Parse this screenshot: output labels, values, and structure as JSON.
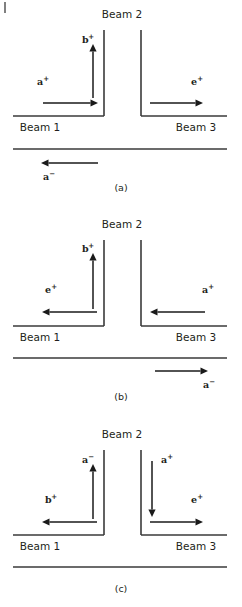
{
  "figure": {
    "width": 242,
    "height": 607,
    "background_color": "#ffffff",
    "line_color": "#3a3a3a",
    "arrow_color": "#1a1a1a",
    "text_color": "#231f20",
    "corner_tick_present": true
  },
  "common_labels": {
    "beam1": "Beam 1",
    "beam2": "Beam 2",
    "beam3": "Beam 3"
  },
  "panels": [
    {
      "id": "panel-a",
      "caption": "(a)",
      "caption_x": 121,
      "caption_y": 191,
      "beam2_label": {
        "text": "Beam 2",
        "x": 122,
        "y": 18
      },
      "beam1_label": {
        "text": "Beam 1",
        "x": 40,
        "y": 131
      },
      "beam3_label": {
        "text": "Beam 3",
        "x": 196,
        "y": 131
      },
      "walls": {
        "left_vertical": {
          "x": 104,
          "y1": 30,
          "y2": 116
        },
        "right_vertical": {
          "x": 141,
          "y1": 30,
          "y2": 116
        },
        "upper_horizontal_left": {
          "x1": 13,
          "x2": 104,
          "y": 116
        },
        "upper_horizontal_right": {
          "x1": 141,
          "x2": 227,
          "y": 116
        },
        "lower_horizontal": {
          "x1": 13,
          "x2": 227,
          "y": 149
        }
      },
      "arrows": [
        {
          "name": "a-plus-input",
          "label": "a",
          "superscript": "+",
          "label_x": 37,
          "label_y": 85,
          "direction": "right",
          "x1": 43,
          "y1": 103,
          "x2": 98,
          "y2": 103
        },
        {
          "name": "b-plus-up",
          "label": "b",
          "superscript": "+",
          "label_x": 82,
          "label_y": 43,
          "direction": "up",
          "x1": 93,
          "y1": 98,
          "x2": 93,
          "y2": 44
        },
        {
          "name": "e-plus-output",
          "label": "e",
          "superscript": "+",
          "label_x": 191,
          "label_y": 85,
          "direction": "right",
          "x1": 150,
          "y1": 103,
          "x2": 203,
          "y2": 103
        },
        {
          "name": "a-minus-return",
          "label": "a",
          "superscript": "−",
          "label_x": 43,
          "label_y": 180,
          "direction": "left",
          "x1": 98,
          "y1": 163,
          "x2": 41,
          "y2": 163
        }
      ]
    },
    {
      "id": "panel-b",
      "caption": "(b)",
      "caption_x": 121,
      "caption_y": 400,
      "beam2_label": {
        "text": "Beam 2",
        "x": 122,
        "y": 228
      },
      "beam1_label": {
        "text": "Beam 1",
        "x": 40,
        "y": 341
      },
      "beam3_label": {
        "text": "Beam 3",
        "x": 196,
        "y": 341
      },
      "walls": {
        "left_vertical": {
          "x": 104,
          "y1": 240,
          "y2": 326
        },
        "right_vertical": {
          "x": 141,
          "y1": 240,
          "y2": 326
        },
        "upper_horizontal_left": {
          "x1": 13,
          "x2": 104,
          "y": 326
        },
        "upper_horizontal_right": {
          "x1": 141,
          "x2": 227,
          "y": 326
        },
        "lower_horizontal": {
          "x1": 13,
          "x2": 227,
          "y": 358
        }
      },
      "arrows": [
        {
          "name": "b-plus-up",
          "label": "b",
          "superscript": "+",
          "label_x": 82,
          "label_y": 252,
          "direction": "up",
          "x1": 93,
          "y1": 309,
          "x2": 93,
          "y2": 253
        },
        {
          "name": "e-plus-output-left",
          "label": "e",
          "superscript": "+",
          "label_x": 45,
          "label_y": 293,
          "direction": "left",
          "x1": 97,
          "y1": 312,
          "x2": 42,
          "y2": 312
        },
        {
          "name": "a-plus-input-right",
          "label": "a",
          "superscript": "+",
          "label_x": 202,
          "label_y": 293,
          "direction": "left",
          "x1": 205,
          "y1": 312,
          "x2": 150,
          "y2": 312
        },
        {
          "name": "a-minus-return",
          "label": "a",
          "superscript": "−",
          "label_x": 203,
          "label_y": 388,
          "direction": "right",
          "x1": 155,
          "y1": 371,
          "x2": 208,
          "y2": 371
        }
      ]
    },
    {
      "id": "panel-c",
      "caption": "(c)",
      "caption_x": 121,
      "caption_y": 592,
      "beam2_label": {
        "text": "Beam 2",
        "x": 122,
        "y": 438
      },
      "beam1_label": {
        "text": "Beam 1",
        "x": 40,
        "y": 550
      },
      "beam3_label": {
        "text": "Beam 3",
        "x": 196,
        "y": 550
      },
      "walls": {
        "left_vertical": {
          "x": 104,
          "y1": 450,
          "y2": 535
        },
        "right_vertical": {
          "x": 141,
          "y1": 450,
          "y2": 535
        },
        "upper_horizontal_left": {
          "x1": 13,
          "x2": 104,
          "y": 535
        },
        "upper_horizontal_right": {
          "x1": 141,
          "x2": 227,
          "y": 535
        },
        "lower_horizontal": {
          "x1": 13,
          "x2": 227,
          "y": 567
        }
      },
      "arrows": [
        {
          "name": "a-minus-up",
          "label": "a",
          "superscript": "−",
          "label_x": 82,
          "label_y": 463,
          "direction": "up",
          "x1": 93,
          "y1": 519,
          "x2": 93,
          "y2": 464
        },
        {
          "name": "b-plus-output-left",
          "label": "b",
          "superscript": "+",
          "label_x": 45,
          "label_y": 503,
          "direction": "left",
          "x1": 97,
          "y1": 522,
          "x2": 42,
          "y2": 522
        },
        {
          "name": "a-plus-down",
          "label": "a",
          "superscript": "+",
          "label_x": 161,
          "label_y": 463,
          "direction": "down",
          "x1": 152,
          "y1": 461,
          "x2": 152,
          "y2": 517
        },
        {
          "name": "e-plus-output-right",
          "label": "e",
          "superscript": "+",
          "label_x": 191,
          "label_y": 503,
          "direction": "right",
          "x1": 150,
          "y1": 522,
          "x2": 203,
          "y2": 522
        }
      ]
    }
  ],
  "corner_tick": {
    "x": 5,
    "y1": 2,
    "y2": 13
  }
}
